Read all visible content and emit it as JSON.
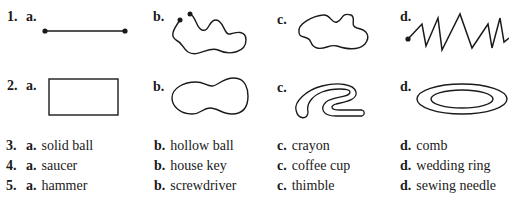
{
  "questions": [
    {
      "number": "1.",
      "type": "figures",
      "options": [
        {
          "letter": "a.",
          "figure": "straight-line-segment-with-endpoints"
        },
        {
          "letter": "b.",
          "figure": "squiggly-open-curve-with-endpoints"
        },
        {
          "letter": "c.",
          "figure": "wavy-closed-curve"
        },
        {
          "letter": "d.",
          "figure": "zigzag-line-with-endpoint"
        }
      ]
    },
    {
      "number": "2.",
      "type": "figures",
      "options": [
        {
          "letter": "a.",
          "figure": "rectangle"
        },
        {
          "letter": "b.",
          "figure": "peanut-shaped-closed-curve"
        },
        {
          "letter": "c.",
          "figure": "curled-band-shape"
        },
        {
          "letter": "d.",
          "figure": "ring-concentric-ellipses"
        }
      ]
    },
    {
      "number": "3.",
      "type": "words",
      "options": [
        {
          "letter": "a.",
          "text": "solid ball"
        },
        {
          "letter": "b.",
          "text": "hollow ball"
        },
        {
          "letter": "c.",
          "text": "crayon"
        },
        {
          "letter": "d.",
          "text": "comb"
        }
      ]
    },
    {
      "number": "4.",
      "type": "words",
      "options": [
        {
          "letter": "a.",
          "text": "saucer"
        },
        {
          "letter": "b.",
          "text": "house key"
        },
        {
          "letter": "c.",
          "text": "coffee cup"
        },
        {
          "letter": "d.",
          "text": "wedding ring"
        }
      ]
    },
    {
      "number": "5.",
      "type": "words",
      "options": [
        {
          "letter": "a.",
          "text": "hammer"
        },
        {
          "letter": "b.",
          "text": "screwdriver"
        },
        {
          "letter": "c.",
          "text": "thimble"
        },
        {
          "letter": "d.",
          "text": "sewing needle"
        }
      ]
    }
  ],
  "colors": {
    "ink": "#1a1a1a",
    "background": "#ffffff"
  }
}
